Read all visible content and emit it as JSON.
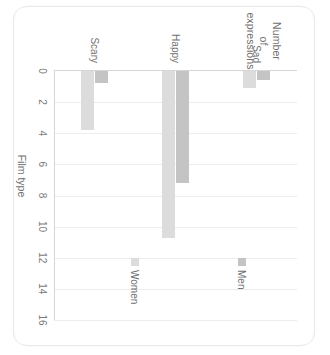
{
  "chart_data": {
    "type": "bar",
    "orientation": "horizontal",
    "title": "",
    "xlabel": "Film type",
    "ylabel": "Number of expressions",
    "ylabel_lines": [
      "Number",
      "of",
      "expressions"
    ],
    "categories": [
      "Sad",
      "Happy",
      "Scary"
    ],
    "series": [
      {
        "name": "Men",
        "color": "#c4c4c4",
        "values": [
          0.6,
          7.2,
          0.8
        ]
      },
      {
        "name": "Women",
        "color": "#dcdcdc",
        "values": [
          1.1,
          10.7,
          3.8
        ]
      }
    ],
    "value_axis": {
      "min": 0,
      "max": 16,
      "tick_step": 2,
      "ticks": [
        "0",
        "2",
        "4",
        "6",
        "8",
        "10",
        "12",
        "14",
        "16"
      ]
    },
    "grid": true,
    "legend_position": "inside-right",
    "legend": [
      "Men",
      "Women"
    ],
    "rotation_degrees": 90
  },
  "colors": {
    "men_bar": "#c4c4c4",
    "women_bar": "#dcdcdc",
    "gridline": "#ededed",
    "axis": "#d6d6d6",
    "text": "#6f6f6f",
    "card_border": "#e8e8e8",
    "background": "#ffffff"
  }
}
